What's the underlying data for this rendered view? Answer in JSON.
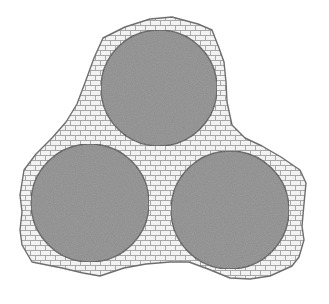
{
  "diagram": {
    "colors": {
      "background": "#ffffff",
      "matrix_fill": "#f2f2f2",
      "brick_line": "#a8a8a8",
      "outline": "#6e6e6e",
      "particle_fill": "#8a8a8a",
      "particle_outline": "#4a4a4a"
    },
    "matrix": {
      "label": "binder-matrix",
      "outline_points": "103,38 125,27 150,19 172,17 198,24 212,30 219,48 224,62 226,82 227,102 232,125 245,138 262,146 281,157 300,170 306,183 304,204 302,226 304,240 299,257 292,266 270,276 250,279 230,278 208,269 189,262 170,262 146,264 124,268 100,276 83,273 62,268 32,262 22,245 20,230 22,212 20,195 24,170 36,154 52,138 66,122 77,104 86,80 94,58"
    },
    "particles": [
      {
        "id": "top",
        "cx": 159,
        "cy": 88,
        "r": 58
      },
      {
        "id": "bottom-left",
        "cx": 90,
        "cy": 203,
        "r": 59
      },
      {
        "id": "bottom-right",
        "cx": 230,
        "cy": 210,
        "r": 59
      }
    ]
  }
}
